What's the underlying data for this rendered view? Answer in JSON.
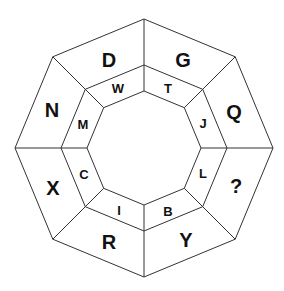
{
  "puzzle": {
    "center": [
      144,
      148
    ],
    "radii": {
      "outer": 129,
      "middle": 83,
      "inner": 57
    },
    "outer_ring": [
      {
        "label": "D",
        "pos": [
          109,
          60
        ]
      },
      {
        "label": "G",
        "pos": [
          183,
          60
        ]
      },
      {
        "label": "Q",
        "pos": [
          234,
          112
        ]
      },
      {
        "label": "?",
        "pos": [
          236,
          186
        ]
      },
      {
        "label": "Y",
        "pos": [
          186,
          240
        ]
      },
      {
        "label": "R",
        "pos": [
          109,
          242
        ]
      },
      {
        "label": "X",
        "pos": [
          53,
          188
        ]
      },
      {
        "label": "N",
        "pos": [
          52,
          110
        ]
      }
    ],
    "inner_ring": [
      {
        "label": "W",
        "pos": [
          118,
          88
        ]
      },
      {
        "label": "T",
        "pos": [
          168,
          88
        ]
      },
      {
        "label": "J",
        "pos": [
          203,
          123
        ]
      },
      {
        "label": "L",
        "pos": [
          203,
          173
        ]
      },
      {
        "label": "B",
        "pos": [
          168,
          211
        ]
      },
      {
        "label": "I",
        "pos": [
          119,
          210
        ]
      },
      {
        "label": "C",
        "pos": [
          84,
          174
        ]
      },
      {
        "label": "M",
        "pos": [
          83,
          124
        ]
      }
    ]
  }
}
